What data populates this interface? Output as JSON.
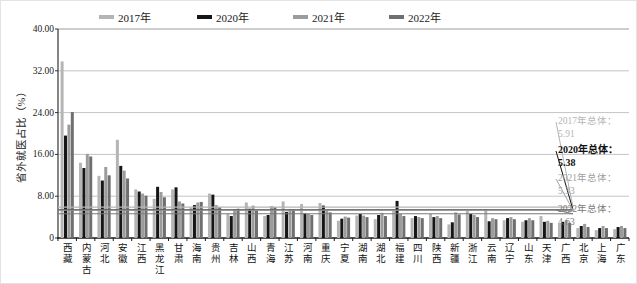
{
  "chart_data": {
    "type": "bar",
    "title": "",
    "ylabel": "省外就医占比（%）",
    "xlabel": "",
    "ylim": [
      0,
      40
    ],
    "yticks": [
      0,
      8,
      16,
      24,
      32,
      40
    ],
    "ytick_labels": [
      "0",
      "8.00",
      "16.00",
      "24.00",
      "32.00",
      "40.00"
    ],
    "grid": true,
    "legend_position": "top",
    "categories": [
      "西藏",
      "内蒙古",
      "河北",
      "安徽",
      "江西",
      "黑龙江",
      "甘肃",
      "海南",
      "贵州",
      "吉林",
      "山西",
      "青海",
      "江苏",
      "河南",
      "重庆",
      "宁夏",
      "湖南",
      "湖北",
      "福建",
      "四川",
      "陕西",
      "新疆",
      "浙江",
      "云南",
      "辽宁",
      "山东",
      "天津",
      "广西",
      "北京",
      "上海",
      "广东"
    ],
    "series": [
      {
        "name": "2017年",
        "color": "#b5b5b5",
        "values": [
          33.8,
          14.4,
          11.9,
          18.8,
          9.3,
          7.5,
          9.3,
          5.8,
          8.5,
          4.6,
          6.8,
          4.2,
          7.0,
          6.5,
          6.7,
          3.3,
          4.3,
          3.6,
          5.2,
          3.8,
          4.6,
          2.6,
          5.2,
          5.5,
          3.4,
          3.1,
          4.2,
          2.7,
          1.9,
          1.5,
          1.7
        ]
      },
      {
        "name": "2020年",
        "color": "#161616",
        "values": [
          19.6,
          13.4,
          11.0,
          13.8,
          8.9,
          9.8,
          9.7,
          6.3,
          8.3,
          4.2,
          5.6,
          4.4,
          5.0,
          4.7,
          6.2,
          3.7,
          4.6,
          4.4,
          7.1,
          4.2,
          4.0,
          3.0,
          4.6,
          3.2,
          3.8,
          3.4,
          3.1,
          3.1,
          2.3,
          1.9,
          2.1
        ]
      },
      {
        "name": "2021年",
        "color": "#9c9c9c",
        "values": [
          21.7,
          16.1,
          13.6,
          12.9,
          8.5,
          8.8,
          7.0,
          6.8,
          6.3,
          5.5,
          6.2,
          6.1,
          5.5,
          4.6,
          5.3,
          4.1,
          4.3,
          4.8,
          4.6,
          4.0,
          4.2,
          4.9,
          4.4,
          3.8,
          4.0,
          3.8,
          3.3,
          3.4,
          2.7,
          2.3,
          2.3
        ]
      },
      {
        "name": "2022年",
        "color": "#6f6f6f",
        "values": [
          24.1,
          15.6,
          12.0,
          11.4,
          8.1,
          7.8,
          6.6,
          6.9,
          5.9,
          5.6,
          5.3,
          5.9,
          5.4,
          4.4,
          4.9,
          3.9,
          4.0,
          4.2,
          4.2,
          3.8,
          3.8,
          4.5,
          4.0,
          3.6,
          3.6,
          3.4,
          2.9,
          2.9,
          2.1,
          1.9,
          1.9
        ]
      }
    ],
    "reference_lines": [
      {
        "label": "2017年总体：",
        "value": 5.91,
        "value_label": "5.91",
        "color": "#b5b5b5",
        "bold": false
      },
      {
        "label": "2020年总体：",
        "value": 5.38,
        "value_label": "5.38",
        "color": "#111111",
        "bold": true
      },
      {
        "label": "2021年总体：",
        "value": 5.33,
        "value_label": "5.33",
        "color": "#a0a0a0",
        "bold": false
      },
      {
        "label": "2022年总体：",
        "value": 4.63,
        "value_label": "4.63",
        "color": "#7a7a7a",
        "bold": false
      }
    ]
  }
}
